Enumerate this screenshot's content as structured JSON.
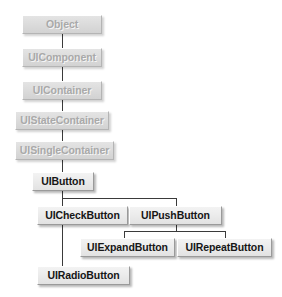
{
  "diagram": {
    "type": "class-hierarchy-tree",
    "colors": {
      "canvas": "#ffffff",
      "box_fill_muted": "#dcdcdc",
      "box_fill_active": "#ececec",
      "text_muted": "#a9a9a9",
      "text_active": "#161616",
      "connector": "#3a3a3a",
      "bevel_light": "#ffffff",
      "bevel_dark": "#9a9a9a"
    },
    "nodes": [
      {
        "id": "object",
        "label": "Object",
        "state": "muted",
        "x": 22,
        "y": 15,
        "w": 80,
        "h": 19
      },
      {
        "id": "uicomponent",
        "label": "UIComponent",
        "state": "muted",
        "x": 22,
        "y": 48,
        "w": 80,
        "h": 19
      },
      {
        "id": "uicontainer",
        "label": "UIContainer",
        "state": "muted",
        "x": 22,
        "y": 81,
        "w": 80,
        "h": 19
      },
      {
        "id": "uistatecontainer",
        "label": "UIStateContainer",
        "state": "muted",
        "x": 15,
        "y": 111,
        "w": 94,
        "h": 19
      },
      {
        "id": "uisinglecontainer",
        "label": "UISingleContainer",
        "state": "muted",
        "x": 15,
        "y": 141,
        "w": 99,
        "h": 19
      },
      {
        "id": "uibutton",
        "label": "UIButton",
        "state": "active",
        "x": 32,
        "y": 172,
        "w": 62,
        "h": 19
      },
      {
        "id": "uicheckbutton",
        "label": "UICheckButton",
        "state": "active",
        "x": 37,
        "y": 206,
        "w": 91,
        "h": 19
      },
      {
        "id": "uipushbutton",
        "label": "UIPushButton",
        "state": "active",
        "x": 129,
        "y": 206,
        "w": 93,
        "h": 19
      },
      {
        "id": "uiexpandbutton",
        "label": "UIExpandButton",
        "state": "active",
        "x": 80,
        "y": 238,
        "w": 95,
        "h": 19
      },
      {
        "id": "uirepeatbutton",
        "label": "UIRepeatButton",
        "state": "active",
        "x": 177,
        "y": 238,
        "w": 95,
        "h": 19
      },
      {
        "id": "uiradiobutton",
        "label": "UIRadioButton",
        "state": "active",
        "x": 37,
        "y": 266,
        "w": 93,
        "h": 19
      }
    ],
    "edges": [
      {
        "from": "object",
        "to": "uicomponent"
      },
      {
        "from": "uicomponent",
        "to": "uicontainer"
      },
      {
        "from": "uicontainer",
        "to": "uistatecontainer"
      },
      {
        "from": "uistatecontainer",
        "to": "uisinglecontainer"
      },
      {
        "from": "uisinglecontainer",
        "to": "uibutton"
      },
      {
        "from": "uibutton",
        "to": "uicheckbutton"
      },
      {
        "from": "uibutton",
        "to": "uipushbutton"
      },
      {
        "from": "uipushbutton",
        "to": "uiexpandbutton"
      },
      {
        "from": "uipushbutton",
        "to": "uirepeatbutton"
      },
      {
        "from": "uicheckbutton",
        "to": "uiradiobutton"
      }
    ],
    "connector_segments": [
      {
        "id": "obj-to-comp",
        "orient": "v",
        "x": 62,
        "y": 34,
        "len": 14
      },
      {
        "id": "comp-to-cont",
        "orient": "v",
        "x": 62,
        "y": 67,
        "len": 14
      },
      {
        "id": "cont-to-state",
        "orient": "v",
        "x": 62,
        "y": 100,
        "len": 11
      },
      {
        "id": "state-to-single",
        "orient": "v",
        "x": 62,
        "y": 130,
        "len": 11
      },
      {
        "id": "single-to-btn",
        "orient": "v",
        "x": 62,
        "y": 160,
        "len": 12
      },
      {
        "id": "btn-stem",
        "orient": "v",
        "x": 62,
        "y": 191,
        "len": 7
      },
      {
        "id": "btn-bus",
        "orient": "h",
        "x": 62,
        "y": 198,
        "len": 114
      },
      {
        "id": "bus-to-check",
        "orient": "v",
        "x": 62,
        "y": 198,
        "len": 8
      },
      {
        "id": "bus-to-push",
        "orient": "v",
        "x": 176,
        "y": 198,
        "len": 8
      },
      {
        "id": "push-stem",
        "orient": "v",
        "x": 176,
        "y": 225,
        "len": 6
      },
      {
        "id": "push-bus",
        "orient": "h",
        "x": 124,
        "y": 231,
        "len": 101
      },
      {
        "id": "bus-to-expand",
        "orient": "v",
        "x": 124,
        "y": 231,
        "len": 7
      },
      {
        "id": "bus-to-repeat",
        "orient": "v",
        "x": 225,
        "y": 231,
        "len": 7
      },
      {
        "id": "check-to-radio",
        "orient": "v",
        "x": 62,
        "y": 225,
        "len": 41
      }
    ]
  }
}
